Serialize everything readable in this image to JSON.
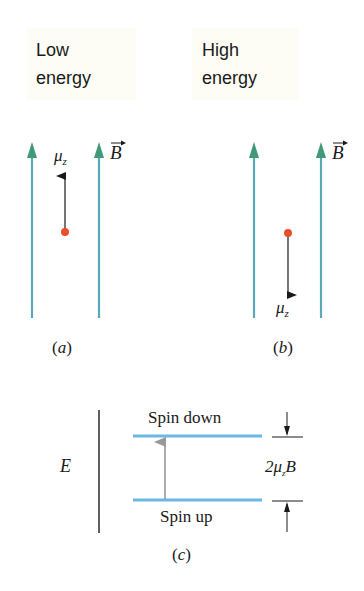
{
  "panel_a": {
    "title_line1": "Low",
    "title_line2": "energy",
    "moment_label": "μ",
    "moment_sub": "z",
    "field_label": "B",
    "caption": "(a)",
    "moment_direction": "up"
  },
  "panel_b": {
    "title_line1": "High",
    "title_line2": "energy",
    "moment_label": "μ",
    "moment_sub": "z",
    "field_label": "B",
    "caption": "(b)",
    "moment_direction": "down"
  },
  "panel_c": {
    "axis_label": "E",
    "upper_level_label": "Spin down",
    "lower_level_label": "Spin up",
    "gap_label_prefix": "2μ",
    "gap_label_sub": "z",
    "gap_label_suffix": "B",
    "caption": "(c)"
  },
  "colors": {
    "field_line": "#5aa8b8",
    "field_arrowhead": "#3f9a78",
    "particle": "#e8502a",
    "energy_level": "#6bb8e6",
    "transition_arrow": "#999999",
    "ink": "#1a1a1a"
  }
}
